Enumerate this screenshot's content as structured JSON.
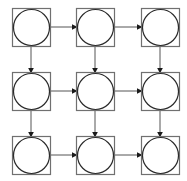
{
  "diagram": {
    "type": "grid-flow",
    "rows": 3,
    "cols": 3,
    "colors": {
      "box_stroke": "#707070",
      "circle_stroke": "#2a2a2a",
      "arrow_stroke": "#555555",
      "arrow_head": "#1a1a1a",
      "background": "#ffffff"
    },
    "node_size": 38,
    "circle_radius": 18,
    "col_x": [
      12,
      76,
      141
    ],
    "row_y": [
      8,
      72,
      136
    ],
    "nodes": [
      {
        "id": "n11",
        "row": 0,
        "col": 0,
        "label": ""
      },
      {
        "id": "n12",
        "row": 0,
        "col": 1,
        "label": ""
      },
      {
        "id": "n13",
        "row": 0,
        "col": 2,
        "label": ""
      },
      {
        "id": "n21",
        "row": 1,
        "col": 0,
        "label": ""
      },
      {
        "id": "n22",
        "row": 1,
        "col": 1,
        "label": ""
      },
      {
        "id": "n23",
        "row": 1,
        "col": 2,
        "label": ""
      },
      {
        "id": "n31",
        "row": 2,
        "col": 0,
        "label": ""
      },
      {
        "id": "n32",
        "row": 2,
        "col": 1,
        "label": ""
      },
      {
        "id": "n33",
        "row": 2,
        "col": 2,
        "label": ""
      }
    ],
    "edges": [
      {
        "from": "n11",
        "to": "n12",
        "direction": "right"
      },
      {
        "from": "n12",
        "to": "n13",
        "direction": "right"
      },
      {
        "from": "n21",
        "to": "n22",
        "direction": "right"
      },
      {
        "from": "n22",
        "to": "n23",
        "direction": "right"
      },
      {
        "from": "n31",
        "to": "n32",
        "direction": "right"
      },
      {
        "from": "n32",
        "to": "n33",
        "direction": "right"
      },
      {
        "from": "n11",
        "to": "n21",
        "direction": "down"
      },
      {
        "from": "n21",
        "to": "n31",
        "direction": "down"
      },
      {
        "from": "n12",
        "to": "n22",
        "direction": "down"
      },
      {
        "from": "n22",
        "to": "n32",
        "direction": "down"
      },
      {
        "from": "n13",
        "to": "n23",
        "direction": "down"
      },
      {
        "from": "n23",
        "to": "n33",
        "direction": "down"
      }
    ]
  }
}
